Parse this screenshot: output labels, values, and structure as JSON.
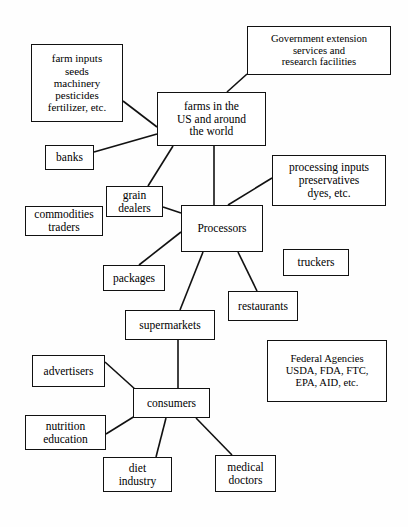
{
  "diagram": {
    "type": "concept-map",
    "canvas": {
      "width": 408,
      "height": 527
    },
    "style": {
      "box_border_color": "#111111",
      "box_fill": "#ffffff",
      "line_color": "#111111",
      "background": "#fefefe"
    },
    "nodes": [
      {
        "id": "farm_inputs",
        "label": "farm inputs\nseeds\nmachinery\npesticides\nfertilizer, etc.",
        "x": 31,
        "y": 44,
        "w": 92,
        "h": 78
      },
      {
        "id": "gov_extension",
        "label": "Government extension\nservices and\nresearch facilities",
        "x": 247,
        "y": 26,
        "w": 144,
        "h": 49
      },
      {
        "id": "farms",
        "label": "farms in the\nUS and around\nthe world",
        "x": 157,
        "y": 92,
        "w": 109,
        "h": 54
      },
      {
        "id": "banks",
        "label": "banks",
        "x": 45,
        "y": 145,
        "w": 49,
        "h": 25
      },
      {
        "id": "processing_inputs",
        "label": "processing inputs\npreservatives\ndyes, etc.",
        "x": 272,
        "y": 155,
        "w": 114,
        "h": 51
      },
      {
        "id": "grain_dealers",
        "label": "grain\ndealers",
        "x": 106,
        "y": 186,
        "w": 57,
        "h": 31
      },
      {
        "id": "commodities",
        "label": "commodities\ntraders",
        "x": 25,
        "y": 206,
        "w": 78,
        "h": 30
      },
      {
        "id": "processors",
        "label": "Processors",
        "x": 181,
        "y": 205,
        "w": 82,
        "h": 47
      },
      {
        "id": "packages",
        "label": "packages",
        "x": 103,
        "y": 265,
        "w": 62,
        "h": 26
      },
      {
        "id": "truckers",
        "label": "truckers",
        "x": 283,
        "y": 249,
        "w": 66,
        "h": 27
      },
      {
        "id": "restaurants",
        "label": "restaurants",
        "x": 228,
        "y": 291,
        "w": 70,
        "h": 30
      },
      {
        "id": "supermarkets",
        "label": "supermarkets",
        "x": 125,
        "y": 310,
        "w": 90,
        "h": 30
      },
      {
        "id": "federal",
        "label": "Federal Agencies\nUSDA, FDA, FTC,\nEPA, AID, etc.",
        "x": 267,
        "y": 340,
        "w": 120,
        "h": 62
      },
      {
        "id": "advertisers",
        "label": "advertisers",
        "x": 32,
        "y": 355,
        "w": 73,
        "h": 32
      },
      {
        "id": "consumers",
        "label": "consumers",
        "x": 133,
        "y": 388,
        "w": 77,
        "h": 30
      },
      {
        "id": "nutrition",
        "label": "nutrition\neducation",
        "x": 25,
        "y": 415,
        "w": 81,
        "h": 35
      },
      {
        "id": "diet_industry",
        "label": "diet\nindustry",
        "x": 103,
        "y": 457,
        "w": 69,
        "h": 35
      },
      {
        "id": "medical",
        "label": "medical\ndoctors",
        "x": 215,
        "y": 455,
        "w": 61,
        "h": 37
      }
    ],
    "edges": [
      {
        "from": "farm_inputs",
        "to": "farms",
        "x1": 123,
        "y1": 101,
        "x2": 157,
        "y2": 127
      },
      {
        "from": "gov_extension",
        "to": "farms",
        "x1": 247,
        "y1": 74,
        "x2": 227,
        "y2": 92
      },
      {
        "from": "banks",
        "to": "farms",
        "x1": 94,
        "y1": 152,
        "x2": 157,
        "y2": 134
      },
      {
        "from": "farms",
        "to": "grain_dealers",
        "x1": 173,
        "y1": 146,
        "x2": 148,
        "y2": 186
      },
      {
        "from": "farms",
        "to": "processors",
        "x1": 214,
        "y1": 146,
        "x2": 214,
        "y2": 205
      },
      {
        "from": "processing_inputs",
        "to": "processors",
        "x1": 272,
        "y1": 178,
        "x2": 228,
        "y2": 205
      },
      {
        "from": "grain_dealers",
        "to": "processors",
        "x1": 163,
        "y1": 207,
        "x2": 181,
        "y2": 213
      },
      {
        "from": "processors",
        "to": "packages",
        "x1": 181,
        "y1": 232,
        "x2": 139,
        "y2": 265
      },
      {
        "from": "processors",
        "to": "supermarkets",
        "x1": 203,
        "y1": 252,
        "x2": 180,
        "y2": 310
      },
      {
        "from": "processors",
        "to": "restaurants",
        "x1": 238,
        "y1": 252,
        "x2": 257,
        "y2": 291
      },
      {
        "from": "supermarkets",
        "to": "consumers",
        "x1": 178,
        "y1": 340,
        "x2": 178,
        "y2": 388
      },
      {
        "from": "advertisers",
        "to": "consumers",
        "x1": 105,
        "y1": 362,
        "x2": 136,
        "y2": 390
      },
      {
        "from": "nutrition",
        "to": "consumers",
        "x1": 106,
        "y1": 434,
        "x2": 135,
        "y2": 416
      },
      {
        "from": "consumers",
        "to": "diet_industry",
        "x1": 166,
        "y1": 418,
        "x2": 156,
        "y2": 457
      },
      {
        "from": "consumers",
        "to": "medical",
        "x1": 196,
        "y1": 418,
        "x2": 232,
        "y2": 455
      }
    ]
  }
}
